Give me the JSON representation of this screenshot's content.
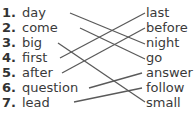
{
  "exercise": {
    "left_items": [
      {
        "number": "1.",
        "word": "day"
      },
      {
        "number": "2.",
        "word": "come"
      },
      {
        "number": "3.",
        "word": "big"
      },
      {
        "number": "4.",
        "word": "first"
      },
      {
        "number": "5.",
        "word": "after"
      },
      {
        "number": "6.",
        "word": "question"
      },
      {
        "number": "7.",
        "word": "lead"
      }
    ],
    "right_items": [
      "last",
      "before",
      "night",
      "go",
      "answer",
      "follow",
      "small"
    ],
    "matches": [
      {
        "left": "day",
        "right": "night"
      },
      {
        "left": "come",
        "right": "go"
      },
      {
        "left": "big",
        "right": "small"
      },
      {
        "left": "first",
        "right": "last"
      },
      {
        "left": "after",
        "right": "before"
      },
      {
        "left": "question",
        "right": "answer"
      },
      {
        "left": "lead",
        "right": "follow"
      }
    ]
  }
}
